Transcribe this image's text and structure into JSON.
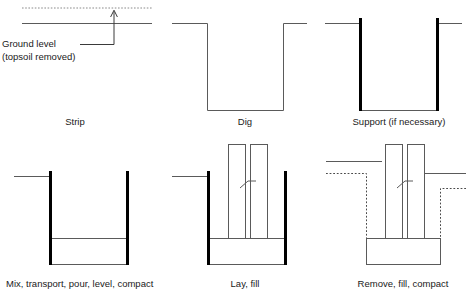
{
  "diagram": {
    "type": "process-sequence",
    "rows": 2,
    "columns": 3,
    "colors": {
      "line": "#5a5a5a",
      "pile": "#000000",
      "dotted": "#8a8a8a",
      "text": "#1a1a1a",
      "background": "#ffffff"
    }
  },
  "annotations": {
    "ground_level": {
      "line1": "Ground level",
      "line2": "(topsoil removed)",
      "pointer": "arrow-up-to-original-ground"
    }
  },
  "panels": [
    {
      "id": "strip",
      "index": 1,
      "label": "Strip",
      "row": 1,
      "column": 1,
      "elements": [
        "original-ground-dotted-line",
        "stripped-ground-solid-line",
        "leader-line-with-arrow"
      ]
    },
    {
      "id": "dig",
      "index": 2,
      "label": "Dig",
      "row": 1,
      "column": 2,
      "elements": [
        "ground-line-left",
        "ground-line-right",
        "open-trench-outline"
      ]
    },
    {
      "id": "support",
      "index": 3,
      "label": "Support (if necessary)",
      "row": 1,
      "column": 3,
      "elements": [
        "ground-line-left",
        "ground-line-right",
        "sheet-pile-left",
        "sheet-pile-right",
        "trench-base-line"
      ]
    },
    {
      "id": "mix-pour",
      "index": 4,
      "label": "Mix, transport, pour, level, compact",
      "row": 2,
      "column": 1,
      "elements": [
        "ground-line-left",
        "sheet-pile-left",
        "sheet-pile-right",
        "trench-base-line",
        "concrete-fill-level-line"
      ]
    },
    {
      "id": "lay-fill",
      "index": 5,
      "label": "Lay, fill",
      "row": 2,
      "column": 2,
      "elements": [
        "ground-line-left",
        "sheet-pile-left",
        "sheet-pile-right",
        "trench-base-line",
        "concrete-fill-level-line",
        "precast-wall-panel-left",
        "precast-wall-panel-right",
        "panel-joint-diagonal"
      ]
    },
    {
      "id": "remove-fill",
      "index": 6,
      "label": "Remove, fill, compact",
      "row": 2,
      "column": 3,
      "elements": [
        "backfilled-ground-line-left",
        "backfilled-ground-line-right",
        "former-trench-outline-dotted",
        "concrete-base-block",
        "precast-wall-panel-left",
        "precast-wall-panel-right",
        "panel-joint-diagonal"
      ]
    }
  ]
}
